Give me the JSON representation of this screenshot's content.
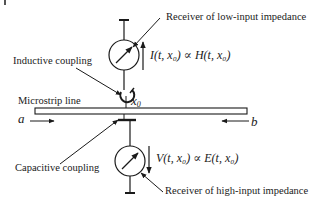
{
  "diagram": {
    "labels": {
      "receiver_low": "Receiver of low-input impedance",
      "receiver_high": "Receiver of high-input impedance",
      "inductive": "Inductive coupling",
      "capacitive": "Capacitive coupling",
      "microstrip": "Microstrip line",
      "port_a": "a",
      "port_b": "b",
      "position": "x",
      "position_sub": "0"
    },
    "equations": {
      "current": "I(t, x₀) ∝ H(t, x₀)",
      "voltage": "V(t, x₀) ∝ E(t, x₀)"
    },
    "colors": {
      "stroke": "#1a1a1a",
      "background": "#ffffff"
    }
  }
}
